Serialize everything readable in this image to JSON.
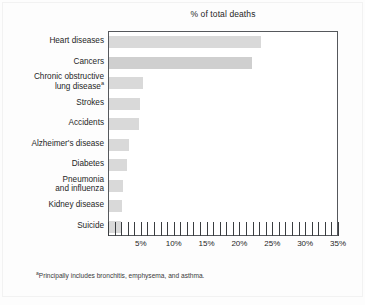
{
  "chart_data": {
    "type": "bar",
    "orientation": "horizontal",
    "title": "% of total deaths",
    "xlabel": "",
    "ylabel": "",
    "xlim": [
      0,
      35
    ],
    "xtick_interval": 1,
    "xlabel_interval": 5,
    "grid": false,
    "legend": null,
    "bar_color": "#d9d9d9",
    "categories": [
      "Heart diseases",
      "Cancers",
      "Chronic obstructive lung disease",
      "Strokes",
      "Accidents",
      "Alzheimer's disease",
      "Diabetes",
      "Pneumonia and influenza",
      "Kidney disease",
      "Suicide"
    ],
    "values": [
      23.2,
      21.8,
      5.1,
      4.7,
      4.5,
      3.1,
      2.8,
      2.2,
      2.0,
      1.8
    ],
    "tick_labels": [
      "5%",
      "10%",
      "15%",
      "20%",
      "25%",
      "30%",
      "35%"
    ],
    "tick_values": [
      5,
      10,
      15,
      20,
      25,
      30,
      35
    ],
    "footnote": "Principally includes bronchitis, emphysema, and asthma.",
    "footnote_marker": "a"
  },
  "labels": {
    "rows": [
      {
        "line1": "Heart diseases",
        "line2": "",
        "marker": ""
      },
      {
        "line1": "Cancers",
        "line2": "",
        "marker": ""
      },
      {
        "line1": "Chronic obstructive",
        "line2": "lung disease",
        "marker": "a"
      },
      {
        "line1": "Strokes",
        "line2": "",
        "marker": ""
      },
      {
        "line1": "Accidents",
        "line2": "",
        "marker": ""
      },
      {
        "line1": "Alzheimer's disease",
        "line2": "",
        "marker": ""
      },
      {
        "line1": "Diabetes",
        "line2": "",
        "marker": ""
      },
      {
        "line1": "Pneumonia",
        "line2": "and influenza",
        "marker": ""
      },
      {
        "line1": "Kidney disease",
        "line2": "",
        "marker": ""
      },
      {
        "line1": "Suicide",
        "line2": "",
        "marker": ""
      }
    ]
  }
}
